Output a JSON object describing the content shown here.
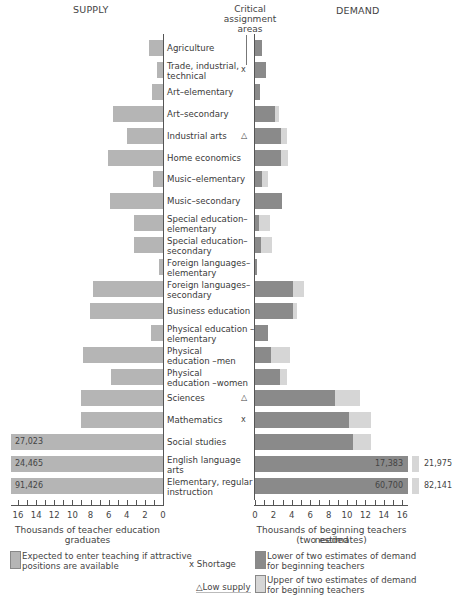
{
  "header": {
    "supply_title": "SUPPLY",
    "critical_title_1": "Critical",
    "critical_title_2": "assignment",
    "critical_title_3": "areas",
    "demand_title": "DEMAND"
  },
  "colors": {
    "supply": "#b5b5b5",
    "demand_lower": "#8a8a8a",
    "demand_upper": "#d6d6d6"
  },
  "chart_data": {
    "type": "bar",
    "orientation": "horizontal-butterfly",
    "categories": [
      "Agriculture",
      "Trade, industrial, technical",
      "Art-elementary",
      "Art-secondary",
      "Industrial arts",
      "Home economics",
      "Music-elementary",
      "Music-secondary",
      "Special education-elementary",
      "Special education-secondary",
      "Foreign languages-elementary",
      "Foreign languages-secondary",
      "Business education",
      "Physical education-elementary",
      "Physical education-men",
      "Physical education-women",
      "Sciences",
      "Mathematics",
      "Social studies",
      "English language arts",
      "Elementary, regular instruction"
    ],
    "series": [
      {
        "name": "Expected to enter teaching if attractive positions are available (supply, thousands)",
        "values": [
          1.5,
          0.7,
          1.2,
          5.5,
          4.0,
          6.1,
          1.1,
          5.9,
          3.2,
          3.2,
          0.4,
          7.7,
          8.1,
          1.3,
          8.8,
          5.7,
          9.1,
          9.0,
          27.023,
          24.465,
          91.426
        ]
      },
      {
        "name": "Lower of two estimates of demand for beginning teachers (thousands)",
        "values": [
          0.8,
          1.2,
          0.5,
          2.2,
          2.8,
          2.8,
          0.8,
          2.9,
          0.4,
          0.7,
          0.2,
          4.1,
          4.1,
          1.4,
          1.7,
          2.7,
          8.7,
          10.2,
          10.6,
          17.383,
          60.7
        ]
      },
      {
        "name": "Upper of two estimates of demand for beginning teachers (thousands)",
        "values": [
          0.8,
          1.2,
          0.5,
          2.6,
          3.5,
          3.6,
          1.4,
          2.9,
          1.6,
          1.8,
          0.2,
          5.3,
          4.6,
          1.4,
          3.8,
          3.5,
          11.4,
          12.6,
          12.6,
          21.975,
          82.141
        ]
      }
    ],
    "critical_markers": {
      "Trade, industrial, technical": "x",
      "Industrial arts": "△",
      "Sciences": "△",
      "Mathematics": "x"
    },
    "supply_xlabel": "Thousands of teacher education graduates",
    "demand_xlabel": "Thousands of beginning teachers needed (two estimates)",
    "supply_xlim": [
      16,
      0
    ],
    "demand_xlim": [
      0,
      16
    ],
    "grid": false,
    "legend_position": "bottom"
  },
  "rows": [
    {
      "label_1": "Agriculture",
      "label_2": "",
      "mark": "",
      "supply": 1.5,
      "lower": 0.8,
      "upper": 0.8
    },
    {
      "label_1": "Trade, industrial,",
      "label_2": "technical",
      "mark": "x",
      "supply": 0.7,
      "lower": 1.2,
      "upper": 1.2
    },
    {
      "label_1": "Art–elementary",
      "label_2": "",
      "mark": "",
      "supply": 1.2,
      "lower": 0.5,
      "upper": 0.5
    },
    {
      "label_1": "Art–secondary",
      "label_2": "",
      "mark": "",
      "supply": 5.5,
      "lower": 2.2,
      "upper": 2.6
    },
    {
      "label_1": "Industrial arts",
      "label_2": "",
      "mark": "△",
      "supply": 4.0,
      "lower": 2.8,
      "upper": 3.5
    },
    {
      "label_1": "Home economics",
      "label_2": "",
      "mark": "",
      "supply": 6.1,
      "lower": 2.8,
      "upper": 3.6
    },
    {
      "label_1": "Music–elementary",
      "label_2": "",
      "mark": "",
      "supply": 1.1,
      "lower": 0.8,
      "upper": 1.4
    },
    {
      "label_1": "Music–secondary",
      "label_2": "",
      "mark": "",
      "supply": 5.9,
      "lower": 2.9,
      "upper": 2.9
    },
    {
      "label_1": "Special education–",
      "label_2": "elementary",
      "mark": "",
      "supply": 3.2,
      "lower": 0.4,
      "upper": 1.6
    },
    {
      "label_1": "Special education–",
      "label_2": "secondary",
      "mark": "",
      "supply": 3.2,
      "lower": 0.7,
      "upper": 1.8
    },
    {
      "label_1": "Foreign languages–",
      "label_2": "elementary",
      "mark": "",
      "supply": 0.4,
      "lower": 0.2,
      "upper": 0.2
    },
    {
      "label_1": "Foreign languages–",
      "label_2": "secondary",
      "mark": "",
      "supply": 7.7,
      "lower": 4.1,
      "upper": 5.3
    },
    {
      "label_1": "Business education",
      "label_2": "",
      "mark": "",
      "supply": 8.1,
      "lower": 4.1,
      "upper": 4.6
    },
    {
      "label_1": "Physical education –",
      "label_2": "elementary",
      "mark": "",
      "supply": 1.3,
      "lower": 1.4,
      "upper": 1.4
    },
    {
      "label_1": "Physical",
      "label_2": "education –men",
      "mark": "",
      "supply": 8.8,
      "lower": 1.7,
      "upper": 3.8
    },
    {
      "label_1": "Physical",
      "label_2": "education –women",
      "mark": "",
      "supply": 5.7,
      "lower": 2.7,
      "upper": 3.5
    },
    {
      "label_1": "Sciences",
      "label_2": "",
      "mark": "△",
      "supply": 9.1,
      "lower": 8.7,
      "upper": 11.4
    },
    {
      "label_1": "Mathematics",
      "label_2": "",
      "mark": "x",
      "supply": 9.0,
      "lower": 10.2,
      "upper": 12.6
    },
    {
      "label_1": "Social studies",
      "label_2": "",
      "mark": "",
      "supply": 17,
      "lower": 10.6,
      "upper": 12.6,
      "supply_text": "27,023"
    },
    {
      "label_1": "English language",
      "label_2": "arts",
      "mark": "",
      "supply": 17,
      "lower": 16,
      "upper": 17,
      "supply_text": "24,465",
      "lower_text": "17,383",
      "upper_text": "21,975"
    },
    {
      "label_1": "Elementary, regular",
      "label_2": "instruction",
      "mark": "",
      "supply": 17,
      "lower": 16,
      "upper": 17,
      "supply_text": "91,426",
      "lower_text": "60,700",
      "upper_text": "82,141"
    }
  ],
  "axes": {
    "supply_ticks": [
      "16",
      "14",
      "12",
      "10",
      "8",
      "6",
      "4",
      "2",
      "0"
    ],
    "demand_ticks": [
      "0",
      "2",
      "4",
      "6",
      "8",
      "10",
      "12",
      "14",
      "16"
    ],
    "supply_title": "Thousands of teacher education graduates",
    "demand_title_1": "Thousands of beginning teachers needed",
    "demand_title_2": "(two estimates)"
  },
  "legend": {
    "supply_1": "Expected to enter teaching if attractive",
    "supply_2": "positions are available",
    "shortage": "x Shortage",
    "low_supply": "△Low supply",
    "lower_1": "Lower of two estimates of demand",
    "lower_2": "for beginning teachers",
    "upper_1": "Upper of two estimates of demand",
    "upper_2": "for beginning teachers"
  }
}
